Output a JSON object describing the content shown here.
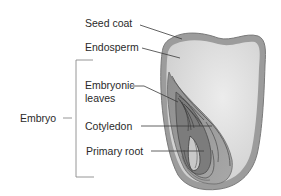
{
  "diagram": {
    "labels": {
      "seed_coat": "Seed coat",
      "endosperm": "Endosperm",
      "embryonic_leaves_line1": "Embryonic",
      "embryonic_leaves_line2": "leaves",
      "cotyledon": "Cotyledon",
      "primary_root": "Primary root",
      "embryo": "Embryo"
    },
    "groups": [
      {
        "name": "Embryo",
        "members": [
          "Embryonic leaves",
          "Cotyledon",
          "Primary root"
        ]
      }
    ],
    "colors": {
      "background": "#ffffff",
      "text": "#2a2a2a",
      "leader_line": "#3a3a3a",
      "bracket": "#8a8a8a",
      "seed_coat": "#8c8c8c",
      "endosperm": "#dcdcdc",
      "embryo_fill": "#9a9a9a",
      "embryo_dark": "#5a5a5a"
    }
  }
}
